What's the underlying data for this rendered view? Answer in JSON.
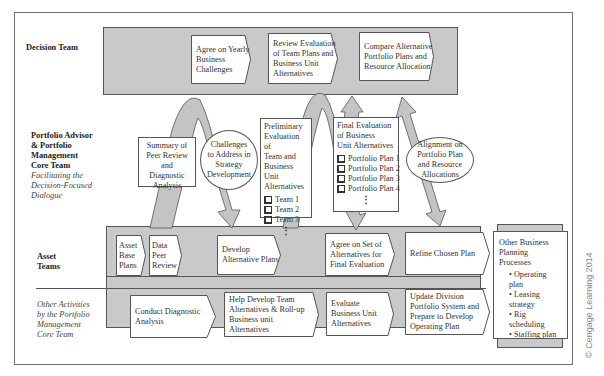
{
  "lanes": {
    "decision_team": {
      "label": "Decision Team"
    },
    "core_team": {
      "label_lines": [
        "Portfolio Advisor",
        "& Portfolio",
        "Management",
        "Core Team"
      ],
      "subtitle_lines": [
        "Facilitating the",
        "Decision-Focused",
        "Dialogue"
      ]
    },
    "asset_teams": {
      "label_lines": [
        "Asset",
        "Teams"
      ]
    },
    "other_activities": {
      "label_lines": [
        "Other Activities",
        "by the Portfolio",
        "Management",
        "Core Team"
      ]
    }
  },
  "decision_steps": [
    {
      "lines": [
        "Agree on Yearly",
        "Business",
        "Challenges"
      ]
    },
    {
      "lines": [
        "Review Evaluation",
        "of Team Plans and",
        "Business Unit",
        "Alternatives"
      ]
    },
    {
      "lines": [
        "Compare Alternative",
        "Portfolio Plans and",
        "Resource Allocation"
      ]
    }
  ],
  "core_items": {
    "summary": {
      "lines": [
        "Summary of",
        "Peer Review",
        "and Diagnostic",
        "Analysis"
      ]
    },
    "challenges": {
      "lines": [
        "Challenges",
        "to Address in",
        "Strategy",
        "Development"
      ]
    },
    "preliminary": {
      "lines": [
        "Preliminary",
        "Evaluation of",
        "Team and",
        "Business Unit",
        "Alternatives"
      ],
      "items": [
        "Team 1",
        "Team 2",
        "Team 3"
      ],
      "more": "⋮"
    },
    "final": {
      "lines": [
        "Final Evaluation",
        "of Business",
        "Unit Alternatives"
      ],
      "items": [
        "Portfolio Plan 1",
        "Portfolio Plan 2",
        "Portfolio Plan 3",
        "Portfolio Plan 4"
      ],
      "more": "⋮"
    },
    "alignment": {
      "lines": [
        "Alignment on",
        "Portfolio Plan",
        "and Resource",
        "Allocations"
      ]
    }
  },
  "asset_steps": [
    {
      "lines": [
        "Asset",
        "Base",
        "Plans"
      ]
    },
    {
      "lines": [
        "Data",
        "Peer",
        "Review"
      ]
    },
    {
      "lines": [
        "Develop",
        "Alternative Plans"
      ]
    },
    {
      "lines": [
        "Agree on Set of",
        "Alternatives for",
        "Final Evaluation"
      ]
    },
    {
      "lines": [
        "Refine Chosen Plan"
      ]
    }
  ],
  "other_steps": [
    {
      "lines": [
        "Conduct Diagnostic",
        "Analysis"
      ]
    },
    {
      "lines": [
        "Help Develop Team",
        "Alternatives & Roll-up",
        "Business unit",
        "Alternatives"
      ]
    },
    {
      "lines": [
        "Evaluate",
        "Business Unit",
        "Alternatives"
      ]
    },
    {
      "lines": [
        "Update Division",
        "Portfolio System and",
        "Prepare to Develop",
        "Operating Plan"
      ]
    }
  ],
  "other_processes": {
    "lines": [
      "Other Business",
      "Planning",
      "Processes"
    ],
    "bullets": [
      "Operating plan",
      "Leasing strategy",
      "Rig scheduling",
      "Staffing plan"
    ]
  },
  "copyright": "© Cengage Learning 2014",
  "colors": {
    "band": "#c9c9c9",
    "arrow": "#c4c4c4",
    "stroke": "#555555"
  }
}
